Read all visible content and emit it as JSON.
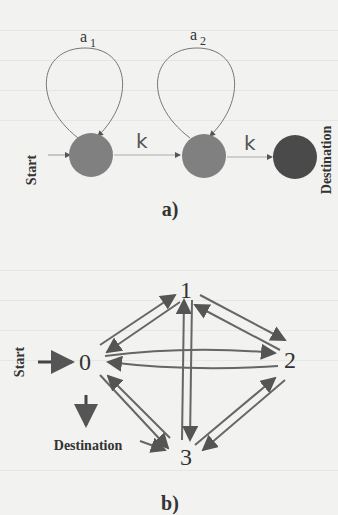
{
  "diagram_a": {
    "caption": "a)",
    "start_label": "Start",
    "destination_label": "Destination",
    "loop_labels": [
      "a",
      "a"
    ],
    "loop_subscripts": [
      "1",
      "2"
    ],
    "edge_labels": [
      "k",
      "k"
    ],
    "node_color": "#808080",
    "destination_color": "#4a4a4a"
  },
  "diagram_b": {
    "caption": "b)",
    "start_label": "Start",
    "destination_label": "Destination",
    "nodes": [
      "0",
      "1",
      "2",
      "3"
    ],
    "edge_color": "#666666"
  }
}
